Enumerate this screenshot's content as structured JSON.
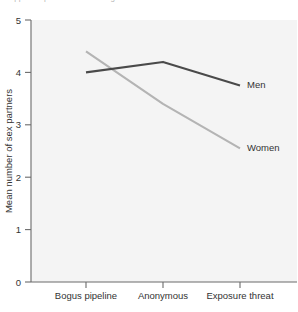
{
  "caption": {
    "text_fragment": "clipped caption text above figure"
  },
  "chart_data": {
    "type": "line",
    "title": "",
    "xlabel": "",
    "ylabel": "Mean number of sex partners",
    "categories": [
      "Bogus pipeline",
      "Anonymous",
      "Exposure threat"
    ],
    "series": [
      {
        "name": "Men",
        "values": [
          4.0,
          4.2,
          3.75
        ],
        "color": "#4a4a4a",
        "line_width": 2.1
      },
      {
        "name": "Women",
        "values": [
          4.4,
          3.4,
          2.55
        ],
        "color": "#b4b4b4",
        "line_width": 2.1
      }
    ],
    "ylim": [
      0,
      5
    ],
    "yticks": [
      0,
      1,
      2,
      3,
      4,
      5
    ],
    "ytick_labels": [
      "0",
      "1",
      "2",
      "3",
      "4",
      "5"
    ],
    "grid": false,
    "legend": "inline-end-labels",
    "plot_background": "#f4f4f4",
    "axis_color": "#6b6b6b"
  },
  "labels": {
    "y_axis_title": "Mean number of sex partners",
    "series_men": "Men",
    "series_women": "Women",
    "cat_0": "Bogus pipeline",
    "cat_1": "Anonymous",
    "cat_2": "Exposure threat",
    "ytick_0": "0",
    "ytick_1": "1",
    "ytick_2": "2",
    "ytick_3": "3",
    "ytick_4": "4",
    "ytick_5": "5"
  }
}
